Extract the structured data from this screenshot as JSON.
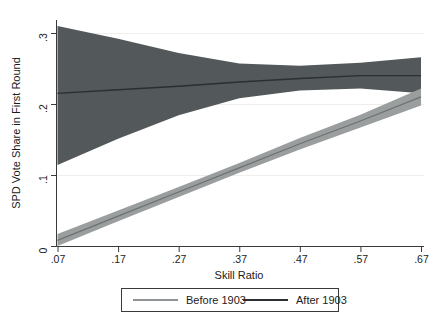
{
  "chart_data": {
    "type": "line",
    "title": "",
    "subtitle": "",
    "xlabel": "Skill Ratio",
    "ylabel": "SPD Vote Share in First Round",
    "xlim": [
      0.07,
      0.67
    ],
    "ylim": [
      0.0,
      0.32
    ],
    "xticks": [
      0.07,
      0.17,
      0.27,
      0.37,
      0.47,
      0.57,
      0.67
    ],
    "xticklabels": [
      ".07",
      ".17",
      ".27",
      ".37",
      ".47",
      ".57",
      ".67"
    ],
    "yticks": [
      0.0,
      0.1,
      0.2,
      0.3
    ],
    "yticklabels": [
      "0",
      ".1",
      ".2",
      ".3"
    ],
    "grid": false,
    "legend_position": "below-plot",
    "series": [
      {
        "name": "Before 1903",
        "color": "#8e9294",
        "line_color": "#6d7173",
        "band_color": "#9a9e9f",
        "x": [
          0.07,
          0.17,
          0.27,
          0.37,
          0.47,
          0.57,
          0.67
        ],
        "values": [
          0.008,
          0.042,
          0.076,
          0.11,
          0.144,
          0.176,
          0.21
        ],
        "ci_lower": [
          0.0,
          0.035,
          0.069,
          0.103,
          0.136,
          0.167,
          0.198
        ],
        "ci_upper": [
          0.017,
          0.05,
          0.083,
          0.117,
          0.152,
          0.185,
          0.222
        ]
      },
      {
        "name": "After 1903",
        "color": "#53585a",
        "line_color": "#2b2f31",
        "band_color": "#53585a",
        "x": [
          0.07,
          0.17,
          0.27,
          0.37,
          0.47,
          0.57,
          0.67
        ],
        "values": [
          0.215,
          0.22,
          0.225,
          0.231,
          0.236,
          0.24,
          0.24
        ],
        "ci_lower": [
          0.114,
          0.151,
          0.184,
          0.208,
          0.219,
          0.222,
          0.215
        ],
        "ci_upper": [
          0.31,
          0.292,
          0.272,
          0.257,
          0.254,
          0.258,
          0.266
        ]
      }
    ]
  },
  "axes": {
    "y_title": "SPD Vote Share in First Round",
    "x_title": "Skill Ratio",
    "x_tick_labels": [
      ".07",
      ".17",
      ".27",
      ".37",
      ".47",
      ".57",
      ".67"
    ],
    "y_tick_labels": [
      ".3",
      ".2",
      ".1",
      "0"
    ]
  },
  "legend": {
    "items": [
      {
        "label": "Before 1903",
        "swatch_color": "#6d7173"
      },
      {
        "label": "After 1903",
        "swatch_color": "#2b2f31"
      }
    ]
  },
  "colors": {
    "background": "#ffffff",
    "axis": "#3a3a3a",
    "text": "#1b1b1b",
    "before_band": "#9a9e9f",
    "before_line": "#6d7173",
    "after_band": "#53585a",
    "after_line": "#2b2f31",
    "legend_border": "#3a3a3a"
  }
}
